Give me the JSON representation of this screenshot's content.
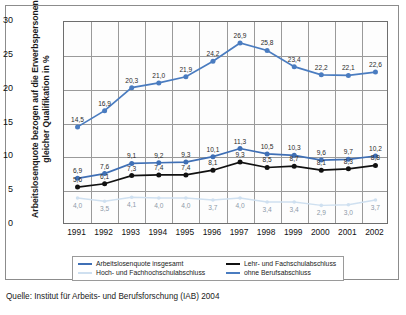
{
  "figure": {
    "y_axis_title": "Arbeitslosenquote bezogen auf die Erwerbspersonen gleicher Qualifikation in %",
    "source": "Quelle: Institut für Arbeits- und Berufsforschung (IAB) 2004"
  },
  "legend": {
    "items": [
      {
        "label": "Arbeitslosenquote insgesamt",
        "color": "#3f6fb5"
      },
      {
        "label": "Lehr- und Fachschulabschluss",
        "color": "#111111"
      },
      {
        "label": "Hoch- und Fachhochschulabschluss",
        "color": "#cfe0f0"
      },
      {
        "label": "ohne Berufsabschluss",
        "color": "#4a7cc0"
      }
    ]
  },
  "chart_data": {
    "type": "line",
    "title": "",
    "xlabel": "",
    "ylabel": "Arbeitslosenquote bezogen auf die Erwerbspersonen gleicher Qualifikation in %",
    "categories": [
      "1991",
      "1992",
      "1993",
      "1994",
      "1995",
      "1996",
      "1997",
      "1998",
      "1999",
      "2000",
      "2001",
      "2002"
    ],
    "ylim": [
      0,
      30
    ],
    "yticks": [
      0,
      5,
      10,
      15,
      20,
      25,
      30
    ],
    "grid": true,
    "legend_position": "bottom",
    "series": [
      {
        "name": "ohne Berufsabschluss",
        "color": "#4a7cc0",
        "values": [
          14.5,
          16.9,
          20.3,
          21.0,
          21.9,
          24.2,
          26.9,
          25.8,
          23.4,
          22.2,
          22.1,
          22.6
        ],
        "labels": [
          "14,5",
          "16,9",
          "20,3",
          "21,0",
          "21,9",
          "24,2",
          "26,9",
          "25,8",
          "23,4",
          "22,2",
          "22,1",
          "22,6"
        ]
      },
      {
        "name": "Arbeitslosenquote insgesamt",
        "color": "#3f6fb5",
        "values": [
          6.9,
          7.6,
          9.1,
          9.2,
          9.3,
          10.1,
          11.3,
          10.5,
          10.3,
          9.6,
          9.7,
          10.2
        ],
        "labels": [
          "6,9",
          "7,6",
          "9,1",
          "9,2",
          "9,3",
          "10,1",
          "11,3",
          "10,5",
          "10,3",
          "9,6",
          "9,7",
          "10,2"
        ]
      },
      {
        "name": "Lehr- und Fachschulabschluss",
        "color": "#111111",
        "values": [
          5.6,
          6.1,
          7.3,
          7.4,
          7.4,
          8.1,
          9.3,
          8.5,
          8.7,
          8.1,
          8.3,
          8.8
        ],
        "labels": [
          "5,6",
          "6,1",
          "7,3",
          "7,4",
          "7,4",
          "8,1",
          "9,3",
          "8,5",
          "8,7",
          "8,1",
          "8,3",
          "8,8"
        ]
      },
      {
        "name": "Hoch- und Fachhochschulabschluss",
        "color": "#cfe0f0",
        "values": [
          4.0,
          3.5,
          4.1,
          4.0,
          4.0,
          3.7,
          4.0,
          3.4,
          3.4,
          2.9,
          3.0,
          3.7
        ],
        "labels": [
          "4,0",
          "3,5",
          "4,1",
          "4,0",
          "4,0",
          "3,7",
          "4,0",
          "3,4",
          "3,4",
          "2,9",
          "3,0",
          "3,7"
        ]
      }
    ]
  }
}
